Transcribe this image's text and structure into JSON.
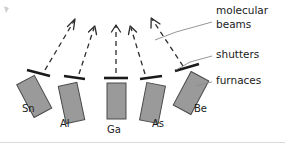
{
  "diagram": {
    "background_color": "#ffffff",
    "furnace_fill_color": "#9a9a9a",
    "furnace_stroke_color": "#4a4a4a",
    "shutter_color": "#1a1a1a",
    "beam_color": "#2b2b2b",
    "leader_color": "#8a8a8a",
    "text_color": "#1a1a1a"
  },
  "sources": [
    {
      "label": "Sn",
      "label_x": 22,
      "label_y": 112,
      "rotation": -28,
      "body": {
        "x": 24,
        "y": 78,
        "w": 20,
        "h": 37
      },
      "shutter": {
        "x1": 27,
        "y1": 70,
        "x2": 50,
        "y2": 76
      },
      "beam": {
        "x1": 45,
        "y1": 70,
        "x2": 74,
        "y2": 21
      },
      "label_anchor": "start"
    },
    {
      "label": "Al",
      "label_x": 60,
      "label_y": 127,
      "rotation": -12,
      "body": {
        "x": 62,
        "y": 84,
        "w": 19,
        "h": 38
      },
      "shutter": {
        "x1": 64,
        "y1": 76,
        "x2": 85,
        "y2": 79
      },
      "beam": {
        "x1": 79,
        "y1": 74,
        "x2": 94,
        "y2": 28
      },
      "label_anchor": "start"
    },
    {
      "label": "Ga",
      "label_x": 107,
      "label_y": 133,
      "rotation": 0,
      "body": {
        "x": 107,
        "y": 83,
        "w": 19,
        "h": 36
      },
      "shutter": {
        "x1": 104,
        "y1": 78,
        "x2": 128,
        "y2": 78
      },
      "beam": {
        "x1": 116,
        "y1": 73,
        "x2": 116,
        "y2": 26
      },
      "label_anchor": "start"
    },
    {
      "label": "As",
      "label_x": 152,
      "label_y": 127,
      "rotation": 11,
      "body": {
        "x": 143,
        "y": 84,
        "w": 19,
        "h": 38
      },
      "shutter": {
        "x1": 140,
        "y1": 79,
        "x2": 162,
        "y2": 76
      },
      "beam": {
        "x1": 145,
        "y1": 74,
        "x2": 131,
        "y2": 28
      },
      "label_anchor": "start"
    },
    {
      "label": "Be",
      "label_x": 194,
      "label_y": 112,
      "rotation": 28,
      "body": {
        "x": 181,
        "y": 74,
        "w": 20,
        "h": 38
      },
      "shutter": {
        "x1": 175,
        "y1": 71,
        "x2": 199,
        "y2": 64
      },
      "beam": {
        "x1": 183,
        "y1": 66,
        "x2": 152,
        "y2": 19
      },
      "label_anchor": "start"
    }
  ],
  "callouts": [
    {
      "name": "molecular-beams",
      "line1": "molecular",
      "line2": "beams",
      "text_x": 216,
      "text_y": 14,
      "line2_y": 28,
      "leader": [
        [
          212,
          22
        ],
        [
          176,
          32
        ],
        [
          155,
          40
        ]
      ]
    },
    {
      "name": "shutters",
      "line1": "shutters",
      "line2": "",
      "text_x": 216,
      "text_y": 58,
      "line2_y": 0,
      "leader": [
        [
          212,
          56
        ],
        [
          190,
          62
        ],
        [
          176,
          70
        ]
      ]
    },
    {
      "name": "furnaces",
      "line1": "furnaces",
      "line2": "",
      "text_x": 216,
      "text_y": 84,
      "line2_y": 0,
      "leader": [
        [
          212,
          82
        ],
        [
          203,
          84
        ],
        [
          196,
          86
        ]
      ]
    }
  ]
}
